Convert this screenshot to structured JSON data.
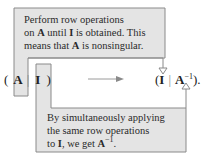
{
  "colors": {
    "box_fill": "#e4e4e4",
    "box_stroke": "#8a8a8a",
    "text": "#2a2a2a"
  },
  "top_note": {
    "line1": "Perform row operations",
    "line2_pre": "on ",
    "line2_A": "A",
    "line2_mid": " until ",
    "line2_I": "I",
    "line2_post": " is obtained. This",
    "line3_pre": "means that ",
    "line3_A": "A",
    "line3_post": " is nonsingular."
  },
  "bottom_note": {
    "line1": "By simultaneously applying",
    "line2": "the same row operations",
    "line3_pre": "to ",
    "line3_I": "I",
    "line3_mid": ", we get ",
    "line3_A": "A",
    "line3_sup": "−1",
    "line3_post": "."
  },
  "equation": {
    "left_open": "(",
    "left_A": "A",
    "left_bar": "|",
    "left_I": "I",
    "left_close": ")",
    "right_open": "(",
    "right_I": "I",
    "right_bar": "|",
    "right_A": "A",
    "right_sup": "−1",
    "right_close": ").",
    "arrow_icon": "right-arrow"
  }
}
